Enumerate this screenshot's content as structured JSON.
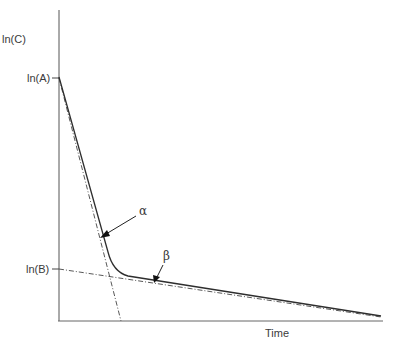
{
  "diagram": {
    "y_axis_label": "ln(C)",
    "x_axis_label": "Time",
    "ticks": {
      "lnA": "ln(A)",
      "lnB": "ln(B)"
    },
    "annotations": {
      "alpha": "α",
      "beta": "β"
    },
    "colors": {
      "line": "#333333",
      "axis": "#555555",
      "background": "#ffffff"
    },
    "series": [
      {
        "name": "ln(C) biexponential curve",
        "style": "solid"
      },
      {
        "name": "alpha phase extrapolation",
        "style": "dash-dot"
      },
      {
        "name": "beta phase extrapolation",
        "style": "dash-dot"
      }
    ]
  }
}
